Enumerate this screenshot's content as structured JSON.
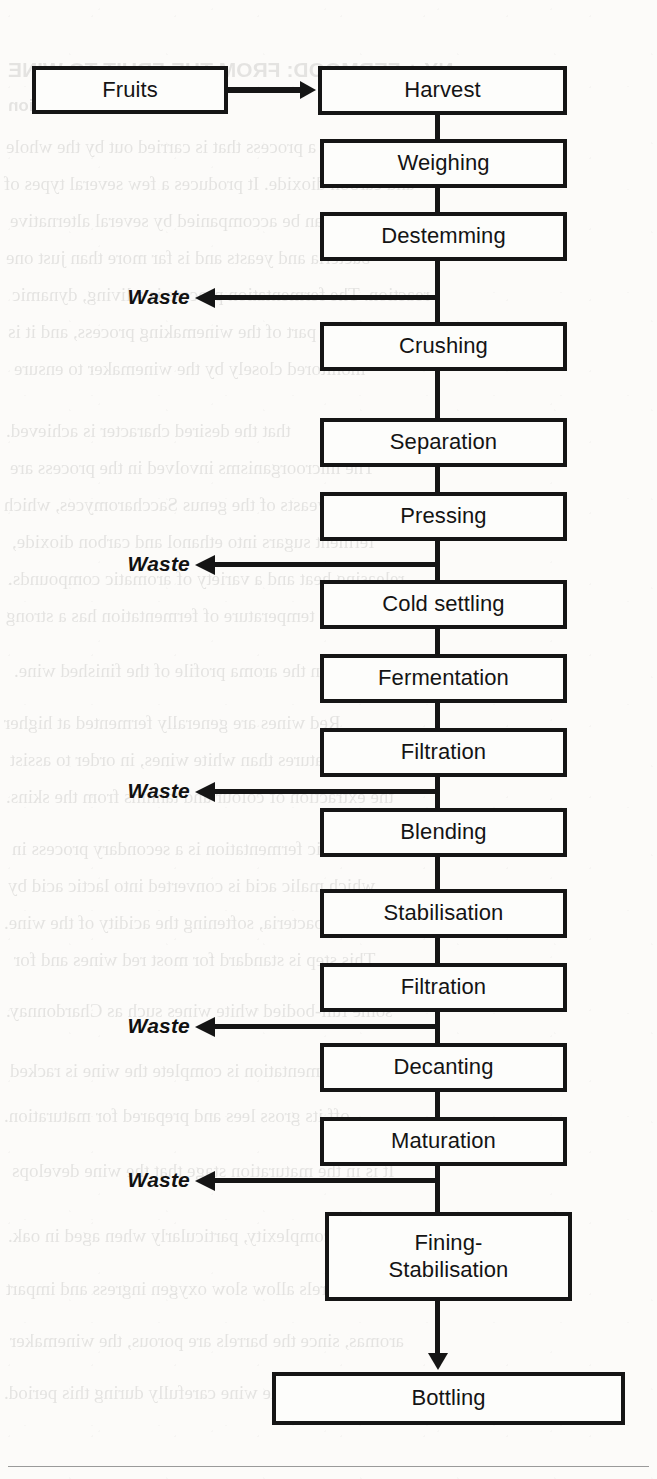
{
  "diagram": {
    "input_node": {
      "label": "Fruits",
      "x": 32,
      "y": 66,
      "w": 196,
      "h": 48
    },
    "chain_x": 320,
    "chain_w": 247,
    "connector_x": 435,
    "nodes": [
      {
        "label": "Harvest",
        "x": 318,
        "y": 66,
        "w": 249,
        "h": 49
      },
      {
        "label": "Weighing",
        "x": 320,
        "y": 139,
        "w": 247,
        "h": 49
      },
      {
        "label": "Destemming",
        "x": 320,
        "y": 212,
        "w": 247,
        "h": 49
      },
      {
        "label": "Crushing",
        "x": 320,
        "y": 322,
        "w": 247,
        "h": 49
      },
      {
        "label": "Separation",
        "x": 320,
        "y": 418,
        "w": 247,
        "h": 49
      },
      {
        "label": "Pressing",
        "x": 320,
        "y": 492,
        "w": 247,
        "h": 49
      },
      {
        "label": "Cold settling",
        "x": 320,
        "y": 580,
        "w": 247,
        "h": 49
      },
      {
        "label": "Fermentation",
        "x": 320,
        "y": 654,
        "w": 247,
        "h": 49
      },
      {
        "label": "Filtration",
        "x": 320,
        "y": 728,
        "w": 247,
        "h": 49
      },
      {
        "label": "Blending",
        "x": 320,
        "y": 808,
        "w": 247,
        "h": 49
      },
      {
        "label": "Stabilisation",
        "x": 320,
        "y": 889,
        "w": 247,
        "h": 49
      },
      {
        "label": "Filtration",
        "x": 320,
        "y": 963,
        "w": 247,
        "h": 49
      },
      {
        "label": "Decanting",
        "x": 320,
        "y": 1043,
        "w": 247,
        "h": 49
      },
      {
        "label": "Maturation",
        "x": 320,
        "y": 1117,
        "w": 247,
        "h": 49
      }
    ],
    "fining_node": {
      "label": "Fining-\nStabilisation",
      "line1": "Fining-",
      "line2": "Stabilisation",
      "x": 325,
      "y": 1212,
      "w": 247,
      "h": 89
    },
    "output_node": {
      "label": "Bottling",
      "x": 272,
      "y": 1372,
      "w": 353,
      "h": 53
    },
    "waste_label": "Waste",
    "waste_branches": [
      {
        "after": "Destemming",
        "y": 297,
        "label_right": 190,
        "stem_left": 206,
        "stem_right": 440
      },
      {
        "after": "Pressing",
        "y": 564,
        "label_right": 190,
        "stem_left": 206,
        "stem_right": 440
      },
      {
        "after": "Filtration",
        "y": 791,
        "label_right": 190,
        "stem_left": 206,
        "stem_right": 440
      },
      {
        "after": "Filtration",
        "y": 1026,
        "label_right": 190,
        "stem_left": 206,
        "stem_right": 440
      },
      {
        "after": "Maturation",
        "y": 1180,
        "label_right": 190,
        "stem_left": 206,
        "stem_right": 440
      }
    ],
    "colors": {
      "ink": "#151515",
      "node_fill": "#fdfdfb",
      "page": "#fcfbf9",
      "rule": "#9a9a9a"
    }
  },
  "page_bleed": {
    "heading": "NY + FERMOOD: FROM THE FRUIT TO WINE",
    "subheading": "Fermentation",
    "lines": [
      "a process that is carried out by the whole",
      "and carbon dioxide. It produces a few several types of",
      "alcohol. It can be accompanied by several alternative",
      "bacteria and yeasts and is far more than just one",
      "reaction. The fermentation process is a living, dynamic",
      "part of the winemaking process, and it is",
      "monitored closely by the winemaker to ensure",
      "that the desired character is achieved.",
      "The microorganisms involved in the process are",
      "mainly yeasts of the genus Saccharomyces, which",
      "ferment sugars into ethanol and carbon dioxide,",
      "releasing heat and a variety of aromatic compounds.",
      "The temperature of fermentation has a strong",
      "influence upon the aroma profile of the finished wine.",
      "Red wines are generally fermented at higher",
      "temperatures than white wines, in order to assist",
      "the extraction of colour and tannins from the skins.",
      "Malolactic fermentation is a secondary process in",
      "which malic acid is converted into lactic acid by",
      "lactic acid bacteria, softening the acidity of the wine.",
      "This step is standard for most red wines and for",
      "some full-bodied white wines such as Chardonnay.",
      "After fermentation is complete the wine is racked",
      "off its gross lees and prepared for maturation.",
      "It is in the maturation stage that the wine develops",
      "further complexity, particularly when aged in oak.",
      "Oak barrels allow slow oxygen ingress and impart",
      "aromas, since the barrels are porous, the winemaker",
      "must monitor the wine carefully during this period."
    ]
  }
}
